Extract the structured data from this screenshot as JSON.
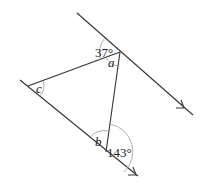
{
  "diagram": {
    "type": "geometry-parallel-lines-triangle",
    "lines": [
      {
        "name": "upper-parallel-line",
        "from": [
          77,
          13
        ],
        "to": [
          193,
          115
        ],
        "arrow_at": [
          183,
          107
        ]
      },
      {
        "name": "lower-parallel-line",
        "from": [
          20,
          80
        ],
        "to": [
          138,
          176
        ],
        "arrow_at": [
          136,
          175
        ]
      }
    ],
    "vertices": {
      "A": [
        120,
        52
      ],
      "B": [
        106,
        152
      ],
      "C": [
        28,
        86
      ]
    },
    "labels": {
      "angle_37": "37°",
      "angle_a": "a",
      "angle_c": "c",
      "angle_b": "b",
      "angle_143": "143°"
    },
    "colors": {
      "line": "#333333",
      "arc": "#9a9a9a",
      "text": "#222222"
    }
  }
}
